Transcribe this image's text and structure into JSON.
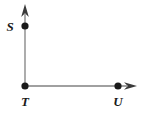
{
  "figure": {
    "background_color": "#ffffff",
    "width": 145,
    "height": 114,
    "line_color": "#808080",
    "point_color": "#1a1a1a",
    "arrow_color": "#333333",
    "line_width": 1.3,
    "point_radius": 3.6,
    "points": [
      {
        "name": "S",
        "label": "S",
        "x": 25,
        "y": 26,
        "label_x": 10,
        "label_y": 30
      },
      {
        "name": "T",
        "label": "T",
        "x": 25,
        "y": 86,
        "label_x": 25,
        "label_y": 105
      },
      {
        "name": "U",
        "label": "U",
        "x": 118,
        "y": 86,
        "label_x": 118,
        "label_y": 105
      }
    ],
    "rays": [
      {
        "name": "ray-TS-vertical",
        "from": "T",
        "through": "S",
        "direction": "up",
        "x1": 25,
        "y1": 86,
        "x2": 25,
        "y2": 14,
        "arrow_tip_x": 25,
        "arrow_tip_y": 4
      },
      {
        "name": "ray-TU-horizontal",
        "from": "T",
        "through": "U",
        "direction": "right",
        "x1": 25,
        "y1": 86,
        "x2": 127,
        "y2": 86,
        "arrow_tip_x": 137,
        "arrow_tip_y": 86
      }
    ],
    "arrowheads": [
      {
        "name": "arrowhead-up",
        "points": "25,4 21.2,16.5 25,13.6 28.8,16.5"
      },
      {
        "name": "arrowhead-right",
        "points": "137,86 124.5,82.2 127.4,86 124.5,89.8"
      }
    ]
  }
}
